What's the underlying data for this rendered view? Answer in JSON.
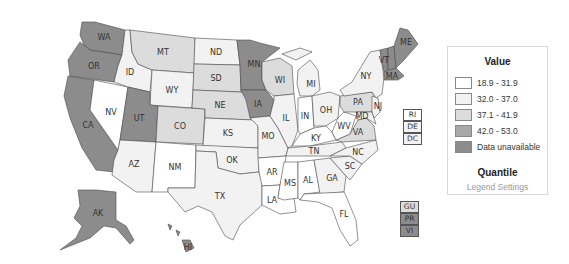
{
  "colors": {
    "c1": "#ffffff",
    "c2": "#f2f2f2",
    "c3": "#dcdcdc",
    "c4": "#a9a9a9",
    "na": "#8c8c8c"
  },
  "legend": {
    "title": "Value",
    "items": [
      {
        "label": "18.9 - 31.9",
        "class": "c1"
      },
      {
        "label": "32.0 - 37.0",
        "class": "c2"
      },
      {
        "label": "37.1 - 41.9",
        "class": "c3"
      },
      {
        "label": "42.0 - 53.0",
        "class": "c4"
      },
      {
        "label": "Data unavailable",
        "class": "na"
      }
    ],
    "method": "Quantile",
    "settings_link": "Legend Settings"
  },
  "states": [
    {
      "abbr": "WA",
      "class": "na"
    },
    {
      "abbr": "OR",
      "class": "na"
    },
    {
      "abbr": "CA",
      "class": "na"
    },
    {
      "abbr": "NV",
      "class": "c1"
    },
    {
      "abbr": "ID",
      "class": "c2"
    },
    {
      "abbr": "MT",
      "class": "c3"
    },
    {
      "abbr": "WY",
      "class": "c2"
    },
    {
      "abbr": "UT",
      "class": "na"
    },
    {
      "abbr": "CO",
      "class": "c3"
    },
    {
      "abbr": "AZ",
      "class": "c2"
    },
    {
      "abbr": "NM",
      "class": "c1"
    },
    {
      "abbr": "ND",
      "class": "c2"
    },
    {
      "abbr": "SD",
      "class": "c3"
    },
    {
      "abbr": "NE",
      "class": "c3"
    },
    {
      "abbr": "KS",
      "class": "c2"
    },
    {
      "abbr": "OK",
      "class": "c2"
    },
    {
      "abbr": "TX",
      "class": "c2"
    },
    {
      "abbr": "MN",
      "class": "na"
    },
    {
      "abbr": "IA",
      "class": "na"
    },
    {
      "abbr": "MO",
      "class": "c2"
    },
    {
      "abbr": "AR",
      "class": "c1"
    },
    {
      "abbr": "LA",
      "class": "c1"
    },
    {
      "abbr": "WI",
      "class": "c3"
    },
    {
      "abbr": "IL",
      "class": "c2"
    },
    {
      "abbr": "MI",
      "class": "c2"
    },
    {
      "abbr": "IN",
      "class": "c1"
    },
    {
      "abbr": "OH",
      "class": "c2"
    },
    {
      "abbr": "KY",
      "class": "c1"
    },
    {
      "abbr": "TN",
      "class": "c2"
    },
    {
      "abbr": "MS",
      "class": "c1"
    },
    {
      "abbr": "AL",
      "class": "c1"
    },
    {
      "abbr": "GA",
      "class": "c2"
    },
    {
      "abbr": "FL",
      "class": "c1"
    },
    {
      "abbr": "SC",
      "class": "c2"
    },
    {
      "abbr": "NC",
      "class": "c2"
    },
    {
      "abbr": "VA",
      "class": "c3"
    },
    {
      "abbr": "WV",
      "class": "c1"
    },
    {
      "abbr": "PA",
      "class": "c3"
    },
    {
      "abbr": "NY",
      "class": "c2"
    },
    {
      "abbr": "VT",
      "class": "na"
    },
    {
      "abbr": "NH",
      "class": "na"
    },
    {
      "abbr": "ME",
      "class": "na"
    },
    {
      "abbr": "MA",
      "class": "na"
    },
    {
      "abbr": "NJ",
      "class": "c2"
    },
    {
      "abbr": "MD",
      "class": "c2"
    },
    {
      "abbr": "AK",
      "class": "na"
    },
    {
      "abbr": "HI",
      "class": "na"
    }
  ],
  "small_states": [
    {
      "abbr": "RI",
      "class": "c1"
    },
    {
      "abbr": "DE",
      "class": "c2"
    },
    {
      "abbr": "DC",
      "class": "c2"
    }
  ],
  "territories": [
    {
      "abbr": "GU",
      "class": "c3"
    },
    {
      "abbr": "PR",
      "class": "na"
    },
    {
      "abbr": "VI",
      "class": "na"
    }
  ]
}
